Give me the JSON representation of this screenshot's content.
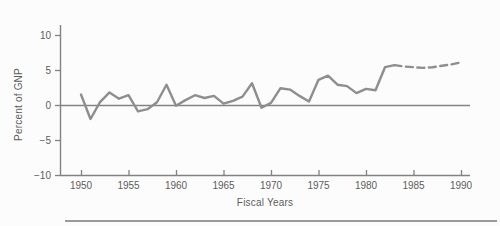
{
  "figure": {
    "background": "#fcfcfc"
  },
  "colors": {
    "axis": "#828282",
    "line": "#8e8e8e",
    "text": "#5c5c5c",
    "bottom_rule": "#9a9a9a"
  },
  "chart_data": {
    "type": "line",
    "title": "",
    "xlabel": "Fiscal Years",
    "ylabel": "Percent of GNP",
    "xlim": [
      1950,
      1990
    ],
    "ylim": [
      -10,
      10
    ],
    "x_ticks": [
      1950,
      1955,
      1960,
      1965,
      1970,
      1975,
      1980,
      1985,
      1990
    ],
    "y_ticks": [
      10,
      5,
      0,
      -5,
      -10
    ],
    "y_tick_labels": [
      "10",
      "5",
      "0",
      "−5",
      "−10"
    ],
    "grid": false,
    "legend": "none",
    "zero_baseline": true,
    "series": [
      {
        "name": "solid-actual",
        "style": "solid",
        "x": [
          1950,
          1951,
          1952,
          1953,
          1954,
          1955,
          1956,
          1957,
          1958,
          1959,
          1960,
          1961,
          1962,
          1963,
          1964,
          1965,
          1966,
          1967,
          1968,
          1969,
          1970,
          1971,
          1972,
          1973,
          1974,
          1975,
          1976,
          1977,
          1978,
          1979,
          1980,
          1981,
          1982,
          1983
        ],
        "values": [
          1.5,
          -2.0,
          0.4,
          1.8,
          0.9,
          1.4,
          -0.9,
          -0.6,
          0.4,
          2.9,
          -0.1,
          0.7,
          1.4,
          1.0,
          1.3,
          0.2,
          0.6,
          1.2,
          3.1,
          -0.4,
          0.3,
          2.4,
          2.2,
          1.3,
          0.5,
          3.6,
          4.2,
          2.9,
          2.7,
          1.7,
          2.3,
          2.1,
          5.4,
          5.7
        ]
      },
      {
        "name": "dashed-projection",
        "style": "dashed",
        "x": [
          1983,
          1984,
          1985,
          1986,
          1987,
          1988,
          1989,
          1990
        ],
        "values": [
          5.7,
          5.5,
          5.4,
          5.3,
          5.4,
          5.6,
          5.8,
          6.1
        ]
      }
    ]
  }
}
